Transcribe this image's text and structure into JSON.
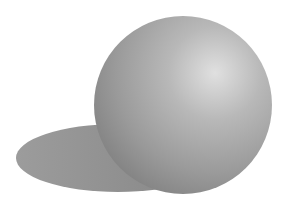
{
  "scene": {
    "background": "#ffffff",
    "sphere": {
      "cx": 183,
      "cy": 105,
      "r": 89,
      "highlight": "#dcdcdc",
      "mid": "#a6a6a6",
      "dark": "#7e7e7e"
    },
    "shadow": {
      "cx": 118,
      "cy": 158,
      "rx": 102,
      "ry": 34,
      "color": "#8e8e8e"
    }
  }
}
